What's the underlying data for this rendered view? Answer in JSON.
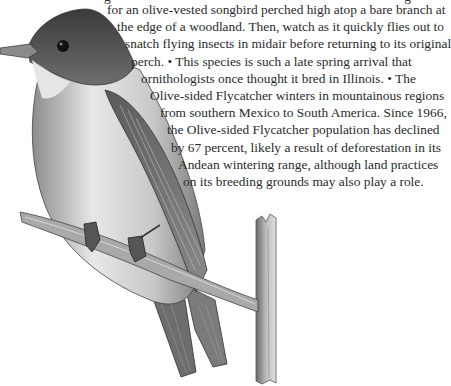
{
  "article": {
    "partial_top_line": "g                                                                      g",
    "lines": [
      "for an olive-vested songbird perched high atop a bare branch at",
      "the edge of a woodland. Then, watch as it quickly flies out to",
      "snatch flying insects in midair before returning to its original",
      "perch. • This species is such a late spring arrival that",
      "ornithologists once thought it bred in Illinois. • The",
      "Olive-sided Flycatcher winters in mountainous regions",
      "from southern Mexico to South America. Since 1966,",
      "the Olive-sided Flycatcher population has declined",
      "by 67 percent, likely a result of deforestation in its",
      "Andean wintering range, although land practices",
      "on its breeding grounds may also play a role."
    ]
  },
  "illustration": {
    "subject": "Olive-sided Flycatcher perched on a bare branch",
    "style": "grayscale pencil drawing"
  }
}
